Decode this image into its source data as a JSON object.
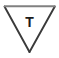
{
  "canvas": {
    "width": 59,
    "height": 58,
    "background_color": "#ffffff"
  },
  "diagram": {
    "name": "downward-pointing-triangle-with-letter",
    "shape": {
      "type": "triangle",
      "orientation": "pointing-down",
      "fill_color": "#ffffff",
      "top_edge_color": "#808080",
      "side_edge_color": "#3a3a3a",
      "stroke_width": 2,
      "vertices": [
        {
          "x": 4,
          "y": 6
        },
        {
          "x": 55,
          "y": 6
        },
        {
          "x": 30,
          "y": 52
        }
      ]
    },
    "label": {
      "text": "T",
      "color": "#1c1c1c",
      "weight": "bold",
      "font_size_px": 14,
      "center_x": 29,
      "top_y": 15
    }
  }
}
